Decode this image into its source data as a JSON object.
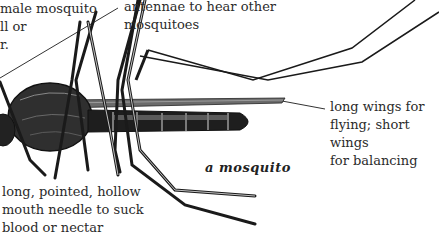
{
  "diagram": {
    "title": "a mosquito",
    "labels": [
      {
        "id": "female-note",
        "text": "male mosquito\nll or\nr."
      },
      {
        "id": "antennae",
        "text": "antennae to hear other\nmosquitoes"
      },
      {
        "id": "wings",
        "text": "long wings for\nflying; short wings\nfor balancing"
      },
      {
        "id": "proboscis",
        "text": "long, pointed, hollow\nmouth needle to suck\nblood or nectar"
      }
    ],
    "colors": {
      "ink": "#1a1a1a",
      "text": "#2b2b2b",
      "background": "#ffffff"
    }
  }
}
